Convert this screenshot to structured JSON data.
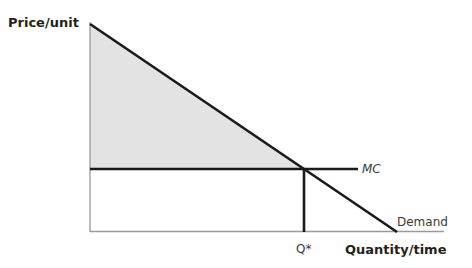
{
  "diagram": {
    "y_axis_label": "Price/unit",
    "x_axis_label": "Quantity/time",
    "curves": {
      "mc_label": "MC",
      "demand_label": "Demand"
    },
    "equilibrium_label": "Q*",
    "shaded_region": "consumer surplus (area above MC, below Demand)",
    "colors": {
      "line": "#1a1a1a",
      "axis": "#9a9a9a",
      "shade": "#e3e3e3"
    }
  }
}
